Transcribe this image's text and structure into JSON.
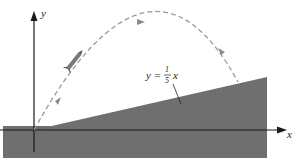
{
  "diagram": {
    "type": "projectile-on-incline",
    "colors": {
      "ground": "#6f6f6f",
      "slope": "#6f6f6f",
      "axes": "#1a1a1a",
      "trajectory": "#9a9a9a",
      "background": "#ffffff"
    },
    "axes": {
      "x_label": "x",
      "y_label": "y"
    },
    "slope_line": {
      "label_prefix": "y = ",
      "fraction_numerator": "1",
      "fraction_denominator": "5",
      "label_suffix": "x"
    },
    "trajectory": {
      "style": "dashed",
      "arrows": [
        "launch",
        "ascending",
        "descending"
      ]
    },
    "projectile": {
      "icon": "rocket"
    }
  }
}
